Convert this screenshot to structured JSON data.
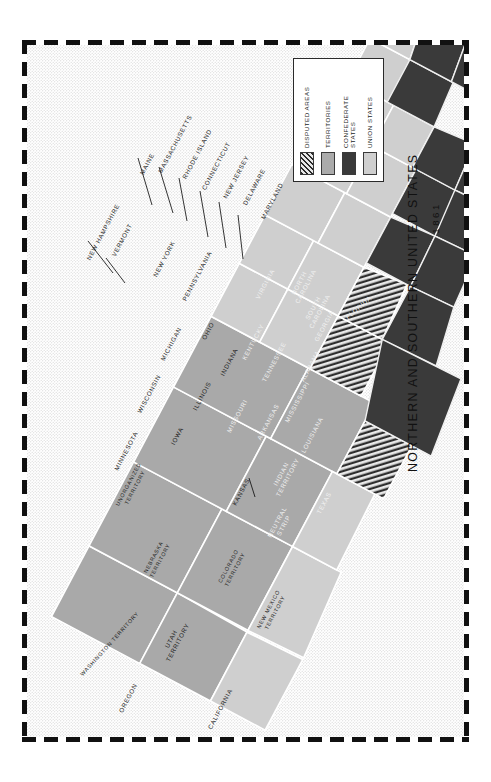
{
  "title": {
    "main": "NORTHERN AND SOUTHERN UNITED STATES",
    "year": "1861"
  },
  "legend": {
    "items": [
      {
        "label": "UNION STATES",
        "key": "union",
        "color": "#cfcfcf"
      },
      {
        "label": "CONFEDERATE\nSTATES",
        "key": "confederate",
        "color": "#3a3a3a"
      },
      {
        "label": "TERRITORIES",
        "key": "territory",
        "color": "#ababab"
      },
      {
        "label": "DISPUTED AREAS",
        "key": "disputed",
        "color": "#cfcfcf"
      }
    ]
  },
  "map": {
    "background_color": "#ffffff",
    "ocean_color": "#f2f2f2",
    "border_color": "#ffffff",
    "regions": [
      {
        "name": "MAINE",
        "category": "union",
        "label_x": 122,
        "label_y": 120,
        "rot": -62
      },
      {
        "name": "NEW HAMPSHIRE",
        "category": "union",
        "label_x": 78,
        "label_y": 188,
        "rot": -62
      },
      {
        "name": "VERMONT",
        "category": "union",
        "label_x": 97,
        "label_y": 196,
        "rot": -62
      },
      {
        "name": "MASSACHUSETTS",
        "category": "union",
        "label_x": 150,
        "label_y": 100,
        "rot": -62
      },
      {
        "name": "RHODE ISLAND",
        "category": "union",
        "label_x": 172,
        "label_y": 110,
        "rot": -62
      },
      {
        "name": "CONNECTICUT",
        "category": "union",
        "label_x": 191,
        "label_y": 122,
        "rot": -62
      },
      {
        "name": "NEW YORK",
        "category": "union",
        "label_x": 139,
        "label_y": 215,
        "rot": -62
      },
      {
        "name": "NEW JERSEY",
        "category": "union",
        "label_x": 211,
        "label_y": 133,
        "rot": -62
      },
      {
        "name": "DELAWARE",
        "category": "union",
        "label_x": 229,
        "label_y": 143,
        "rot": -62
      },
      {
        "name": "MARYLAND",
        "category": "union",
        "label_x": 247,
        "label_y": 157,
        "rot": -62
      },
      {
        "name": "PENNSYLVANIA",
        "category": "union",
        "label_x": 172,
        "label_y": 232,
        "rot": -62
      },
      {
        "name": "OHIO",
        "category": "union",
        "label_x": 183,
        "label_y": 287,
        "rot": -62
      },
      {
        "name": "INDIANA",
        "category": "union",
        "label_x": 204,
        "label_y": 318,
        "rot": -62
      },
      {
        "name": "ILLINOIS",
        "category": "union",
        "label_x": 177,
        "label_y": 352,
        "rot": -62
      },
      {
        "name": "MICHIGAN",
        "category": "union",
        "label_x": 146,
        "label_y": 300,
        "rot": -62
      },
      {
        "name": "WISCONSIN",
        "category": "union",
        "label_x": 124,
        "label_y": 350,
        "rot": -62
      },
      {
        "name": "MINNESOTA",
        "category": "union",
        "label_x": 101,
        "label_y": 407,
        "rot": -62
      },
      {
        "name": "IOWA",
        "category": "union",
        "label_x": 152,
        "label_y": 392,
        "rot": -62
      },
      {
        "name": "KANSAS",
        "category": "union",
        "label_x": 216,
        "label_y": 448,
        "rot": -62
      },
      {
        "name": "OREGON",
        "category": "union",
        "label_x": 103,
        "label_y": 654,
        "rot": -62
      },
      {
        "name": "CALIFORNIA",
        "category": "union",
        "label_x": 195,
        "label_y": 665,
        "rot": -62
      },
      {
        "name": "VIRGINIA",
        "category": "confederate",
        "label_x": 240,
        "label_y": 240,
        "rot": -62
      },
      {
        "name": "NORTH\nCAROLINA",
        "category": "confederate",
        "label_x": 274,
        "label_y": 239,
        "rot": -62
      },
      {
        "name": "SOUTH\nCAROLINA",
        "category": "confederate",
        "label_x": 288,
        "label_y": 264,
        "rot": -62
      },
      {
        "name": "GEORGIA",
        "category": "confederate",
        "label_x": 299,
        "label_y": 282,
        "rot": -62
      },
      {
        "name": "FLORIDA",
        "category": "confederate",
        "label_x": 333,
        "label_y": 264,
        "rot": -40
      },
      {
        "name": "ALABAMA",
        "category": "confederate",
        "label_x": 285,
        "label_y": 322,
        "rot": -62
      },
      {
        "name": "MISSISSIPPI",
        "category": "confederate",
        "label_x": 272,
        "label_y": 358,
        "rot": -62
      },
      {
        "name": "LOUISIANA",
        "category": "confederate",
        "label_x": 287,
        "label_y": 391,
        "rot": -62
      },
      {
        "name": "TENNESSEE",
        "category": "confederate",
        "label_x": 249,
        "label_y": 318,
        "rot": -62
      },
      {
        "name": "ARKANSAS",
        "category": "confederate",
        "label_x": 243,
        "label_y": 378,
        "rot": -62
      },
      {
        "name": "TEXAS",
        "category": "confederate",
        "label_x": 299,
        "label_y": 459,
        "rot": -62
      },
      {
        "name": "KENTUCKY",
        "category": "disputed",
        "label_x": 228,
        "label_y": 298,
        "rot": -62
      },
      {
        "name": "MISSOURI",
        "category": "disputed",
        "label_x": 212,
        "label_y": 372,
        "rot": -62
      },
      {
        "name": "INDIAN\nTERRITORY",
        "category": "disputed",
        "label_x": 256,
        "label_y": 430,
        "rot": -62
      },
      {
        "name": "NEUTRAL\nSTRIP",
        "category": "confederate",
        "label_x": 252,
        "label_y": 478,
        "rot": -62
      },
      {
        "name": "UNORGANIZED\nTERRITORY",
        "category": "territory",
        "label_x": 103,
        "label_y": 440,
        "rot": -62
      },
      {
        "name": "NEBRASKA\nTERRITORY",
        "category": "territory",
        "label_x": 128,
        "label_y": 513,
        "rot": -62
      },
      {
        "name": "COLORADO\nTERRITORY",
        "category": "territory",
        "label_x": 203,
        "label_y": 522,
        "rot": -62
      },
      {
        "name": "NEW MEXICO\nTERRITORY",
        "category": "territory",
        "label_x": 243,
        "label_y": 565,
        "rot": -62
      },
      {
        "name": "UTAH\nTERRITORY",
        "category": "territory",
        "label_x": 146,
        "label_y": 595,
        "rot": -62
      },
      {
        "name": "WASHINGTON TERRITORY",
        "category": "territory",
        "label_x": 84,
        "label_y": 600,
        "rot": -48
      }
    ]
  }
}
